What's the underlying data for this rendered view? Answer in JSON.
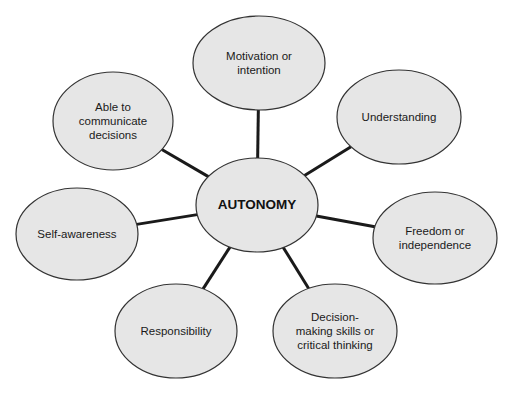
{
  "diagram": {
    "type": "hub-and-spoke concept map",
    "center": {
      "label": "AUTONOMY",
      "cx": 257,
      "cy": 205,
      "rx": 61,
      "ry": 47
    },
    "nodes": [
      {
        "id": "motivation",
        "label": "Motivation or\nintention",
        "cx": 259,
        "cy": 63,
        "rx": 66,
        "ry": 47
      },
      {
        "id": "understanding",
        "label": "Understanding",
        "cx": 399,
        "cy": 117,
        "rx": 62,
        "ry": 47
      },
      {
        "id": "freedom",
        "label": "Freedom or\nindependence",
        "cx": 435,
        "cy": 238,
        "rx": 62,
        "ry": 46
      },
      {
        "id": "decision",
        "label": "Decision-\nmaking skills or\ncritical thinking",
        "cx": 335,
        "cy": 331,
        "rx": 62,
        "ry": 47
      },
      {
        "id": "responsibility",
        "label": "Responsibility",
        "cx": 176,
        "cy": 331,
        "rx": 61,
        "ry": 47
      },
      {
        "id": "self-awareness",
        "label": "Self-awareness",
        "cx": 77,
        "cy": 234,
        "rx": 61,
        "ry": 46
      },
      {
        "id": "communicate",
        "label": "Able to\ncommunicate\ndecisions",
        "cx": 113,
        "cy": 121,
        "rx": 60,
        "ry": 49
      }
    ],
    "colors": {
      "fill": "#e6e6e6",
      "stroke": "#333333",
      "connector": "#1a1a1a",
      "text": "#1a1a1a"
    }
  }
}
